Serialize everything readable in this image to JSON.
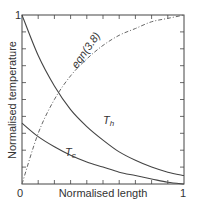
{
  "chart_data": {
    "type": "line",
    "title": "",
    "xlabel": "Normalised length",
    "ylabel": "Normalised temperature",
    "xlim": [
      0,
      1
    ],
    "ylim": [
      0,
      1
    ],
    "x_ticks": [
      "0",
      "1"
    ],
    "y_ticks": [
      "0",
      "1"
    ],
    "grid": false,
    "legend": "inline labels",
    "series": [
      {
        "name": "T_h",
        "label": "T",
        "subscript": "h",
        "style": "solid",
        "x": [
          0,
          0.1,
          0.2,
          0.3,
          0.4,
          0.5,
          0.6,
          0.7,
          0.8,
          0.9,
          1.0
        ],
        "y": [
          1.0,
          0.76,
          0.58,
          0.44,
          0.34,
          0.26,
          0.19,
          0.14,
          0.1,
          0.07,
          0.05
        ]
      },
      {
        "name": "T_c",
        "label": "T",
        "subscript": "c",
        "style": "solid",
        "x": [
          0,
          0.1,
          0.2,
          0.3,
          0.4,
          0.5,
          0.6,
          0.7,
          0.8,
          0.9,
          1.0
        ],
        "y": [
          0.36,
          0.28,
          0.22,
          0.17,
          0.13,
          0.1,
          0.07,
          0.05,
          0.03,
          0.01,
          0.0
        ]
      },
      {
        "name": "eqn(3.8)",
        "label": "eqn(3.8)",
        "style": "dash-dot",
        "x": [
          0,
          0.1,
          0.2,
          0.3,
          0.4,
          0.5,
          0.6,
          0.7,
          0.8,
          0.9,
          1.0
        ],
        "y": [
          0.0,
          0.3,
          0.5,
          0.64,
          0.74,
          0.82,
          0.88,
          0.92,
          0.96,
          0.98,
          1.0
        ]
      }
    ]
  },
  "labels": {
    "x_min": "0",
    "x_max": "1",
    "y_max": "1",
    "xlabel": "Normalised length",
    "ylabel": "Normalised temperature",
    "th_main": "T",
    "th_sub": "h",
    "tc_main": "T",
    "tc_sub": "c",
    "eqn": "eqn(3.8)"
  }
}
